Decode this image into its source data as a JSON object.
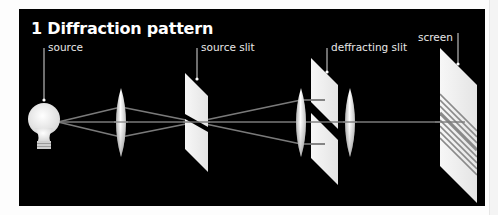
{
  "figure": {
    "title": "1 Diffraction pattern",
    "background": "#000000",
    "beam_color": "#7a7a7a",
    "component_color": "#f0f0f0"
  },
  "labels": {
    "source": "source",
    "source_slit": "source slit",
    "diffracting_slit": "deffracting slit",
    "screen": "screen"
  },
  "components": [
    {
      "id": "source",
      "icon": "light-bulb-icon"
    },
    {
      "id": "lens-1",
      "icon": "convex-lens-icon"
    },
    {
      "id": "source-slit",
      "icon": "single-slit-icon"
    },
    {
      "id": "lens-2",
      "icon": "convex-lens-icon"
    },
    {
      "id": "diffracting-slit",
      "icon": "double-slit-icon"
    },
    {
      "id": "lens-3",
      "icon": "convex-lens-icon"
    },
    {
      "id": "screen",
      "icon": "fringe-screen-icon"
    }
  ]
}
